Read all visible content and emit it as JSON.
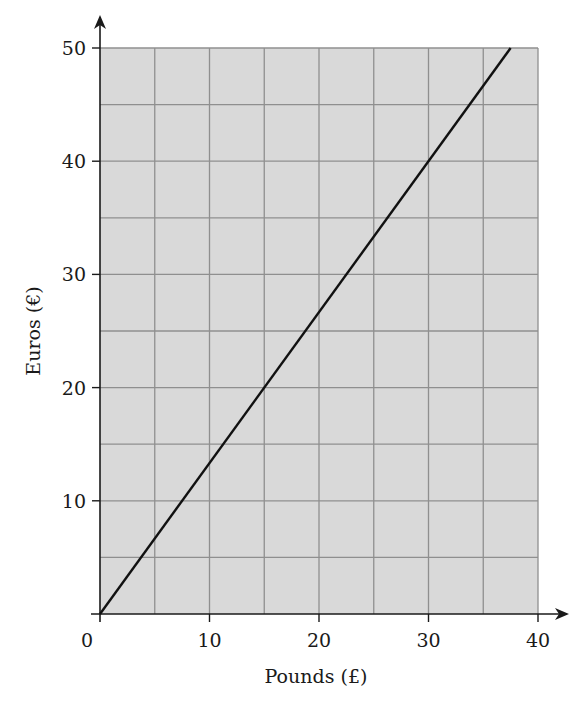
{
  "chart_data": {
    "type": "line",
    "title": "",
    "xlabel": "Pounds (£)",
    "ylabel": "Euros (€)",
    "xlim": [
      0,
      40
    ],
    "ylim": [
      0,
      50
    ],
    "x_ticks": [
      0,
      10,
      20,
      30,
      40
    ],
    "y_ticks": [
      10,
      20,
      30,
      40,
      50
    ],
    "x_tick_labels": [
      "0",
      "10",
      "20",
      "30",
      "40"
    ],
    "y_tick_labels": [
      "10",
      "20",
      "30",
      "40",
      "50"
    ],
    "grid": true,
    "grid_step_x": 5,
    "grid_step_y": 5,
    "legend": null,
    "series": [
      {
        "name": "Pounds to Euros conversion",
        "x": [
          0,
          37.5
        ],
        "y": [
          0,
          50
        ]
      }
    ],
    "colors": {
      "plot_background": "#d9d9d9",
      "grid_line": "#8f8f8f",
      "line": "#111111",
      "axis": "#1a1a1a"
    }
  },
  "labels": {
    "origin": "0",
    "x_axis": "Pounds (£)",
    "y_axis": "Euros (€)"
  }
}
